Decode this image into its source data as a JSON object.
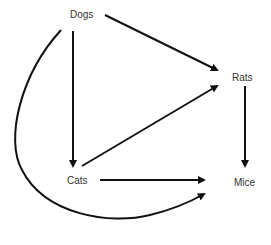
{
  "diagram": {
    "type": "directed-graph",
    "nodes": [
      {
        "id": "dogs",
        "label": "Dogs"
      },
      {
        "id": "rats",
        "label": "Rats"
      },
      {
        "id": "cats",
        "label": "Cats"
      },
      {
        "id": "mice",
        "label": "Mice"
      }
    ],
    "edges": [
      {
        "from": "dogs",
        "to": "rats"
      },
      {
        "from": "dogs",
        "to": "cats"
      },
      {
        "from": "dogs",
        "to": "mice"
      },
      {
        "from": "cats",
        "to": "rats"
      },
      {
        "from": "cats",
        "to": "mice"
      },
      {
        "from": "rats",
        "to": "mice"
      }
    ],
    "colors": {
      "edge": "#111111",
      "label": "#333333",
      "background": "#ffffff"
    }
  }
}
